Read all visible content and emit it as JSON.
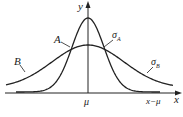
{
  "figure": {
    "type": "normal-distribution-comparison",
    "axes": {
      "y_label": "y",
      "x_label": "x",
      "x_tick_center": "μ",
      "x_tick_deviation": "x−μ"
    },
    "curves": [
      {
        "name": "A",
        "sigma_label": "σA",
        "sigma_sub": "A",
        "shape": "narrow-tall"
      },
      {
        "name": "B",
        "sigma_label": "σB",
        "sigma_sub": "B",
        "shape": "wide-flat"
      }
    ],
    "colors": {
      "line": "#222222",
      "background": "#ffffff"
    }
  },
  "labels": {
    "curve_a": "A",
    "curve_b": "B",
    "sigma": "σ",
    "sigma_a_sub": "A",
    "sigma_b_sub": "B",
    "y": "y",
    "x": "x",
    "mu": "μ",
    "x_minus_mu": "x−μ"
  }
}
